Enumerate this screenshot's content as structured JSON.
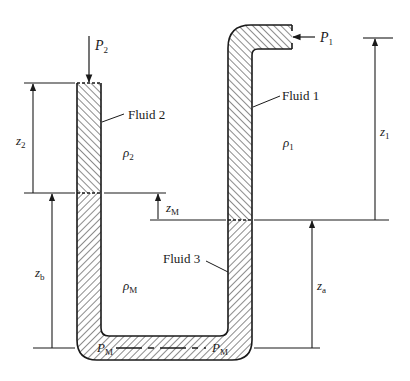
{
  "diagram": {
    "type": "manometer",
    "labels": {
      "fluid1": "Fluid 1",
      "fluid2": "Fluid 2",
      "fluid3": "Fluid 3",
      "p1": {
        "base": "P",
        "sub": "1"
      },
      "p2": {
        "base": "P",
        "sub": "2"
      },
      "pm_left": {
        "base": "P",
        "sub": "M"
      },
      "pm_right": {
        "base": "P",
        "sub": "M"
      },
      "rho1": {
        "base": "ρ",
        "sub": "1"
      },
      "rho2": {
        "base": "ρ",
        "sub": "2"
      },
      "rhoM": {
        "base": "ρ",
        "sub": "M"
      },
      "z1": {
        "base": "z",
        "sub": "1"
      },
      "z2": {
        "base": "z",
        "sub": "2"
      },
      "zM": {
        "base": "z",
        "sub": "M"
      },
      "za": {
        "base": "z",
        "sub": "a"
      },
      "zb": {
        "base": "z",
        "sub": "b"
      }
    },
    "colors": {
      "stroke": "#1a1a1a",
      "background": "#ffffff"
    }
  }
}
